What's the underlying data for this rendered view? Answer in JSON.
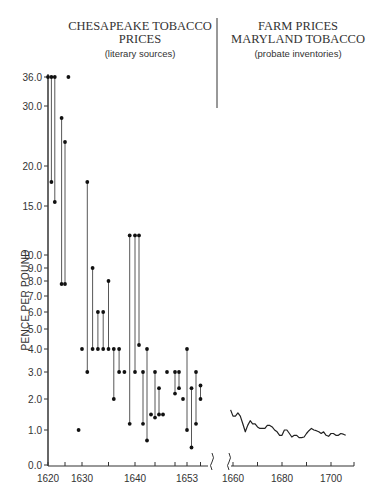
{
  "header": {
    "left_title_line1": "CHESAPEAKE TOBACCO",
    "left_title_line2": "PRICES",
    "left_subtitle": "(literary sources)",
    "right_title_line1": "FARM PRICES",
    "right_title_line2": "MARYLAND TOBACCO",
    "right_subtitle": "(probate inventories)"
  },
  "axis": {
    "ylabel": "PENCE PER POUND",
    "y_ticks": [
      "36.0",
      "30.0",
      "20.0",
      "15.0",
      "10.0",
      "9.0",
      "8.0",
      "7.0",
      "6.0",
      "5.0",
      "4.0",
      "3.0",
      "2.0",
      "1.0",
      "0.0"
    ],
    "x_ticks": [
      "1620",
      "1630",
      "1640",
      "1653",
      "1660",
      "1680",
      "1700"
    ]
  },
  "chart_data": {
    "type": "scatter",
    "xlabel": "",
    "ylabel": "PENCE PER POUND",
    "y_scale": "log-like (non-linear)",
    "ylim": [
      0,
      36
    ],
    "grid": false,
    "legend": null,
    "panels": [
      {
        "name": "Chesapeake Tobacco Prices (literary sources)",
        "type": "range-scatter",
        "note": "Points joined by vertical lines indicate high/low ranges within a year",
        "ranges": [
          {
            "year": 1620,
            "high": 36.0,
            "low": 0.0
          },
          {
            "year": 1621,
            "high": 36.0,
            "low": 18.0
          },
          {
            "year": 1622,
            "high": 36.0,
            "low": 15.5
          },
          {
            "year": 1624,
            "high": 28.0,
            "low": 7.8
          },
          {
            "year": 1625,
            "high": 24.0,
            "low": 7.8
          },
          {
            "year": 1626,
            "high": 36.0,
            "low": 36.0
          },
          {
            "year": 1629,
            "high": 1.0,
            "low": 1.0
          },
          {
            "year": 1630,
            "high": 4.0,
            "low": 4.0
          },
          {
            "year": 1631,
            "high": 18.0,
            "low": 3.0
          },
          {
            "year": 1632,
            "high": 9.0,
            "low": 4.0
          },
          {
            "year": 1633,
            "high": 6.0,
            "low": 4.0
          },
          {
            "year": 1634,
            "high": 6.0,
            "low": 4.0
          },
          {
            "year": 1635,
            "high": 8.0,
            "low": 4.0
          },
          {
            "year": 1636,
            "high": 4.0,
            "low": 2.0
          },
          {
            "year": 1637,
            "high": 4.0,
            "low": 3.0
          },
          {
            "year": 1638,
            "high": 3.0,
            "low": 3.0
          },
          {
            "year": 1639,
            "high": 12.0,
            "low": 1.2
          },
          {
            "year": 1640,
            "high": 12.0,
            "low": 3.0
          },
          {
            "year": 1641,
            "high": 12.0,
            "low": 4.2
          },
          {
            "year": 1642,
            "high": 3.0,
            "low": 1.2
          },
          {
            "year": 1643,
            "high": 4.0,
            "low": 0.7
          },
          {
            "year": 1644,
            "high": 1.5,
            "low": 1.5
          },
          {
            "year": 1645,
            "high": 3.0,
            "low": 1.4
          },
          {
            "year": 1646,
            "high": 2.4,
            "low": 1.5
          },
          {
            "year": 1647,
            "high": 1.5,
            "low": 1.5
          },
          {
            "year": 1648,
            "high": 3.0,
            "low": 3.0
          },
          {
            "year": 1650,
            "high": 3.0,
            "low": 2.2
          },
          {
            "year": 1651,
            "high": 3.0,
            "low": 2.4
          },
          {
            "year": 1652,
            "high": 2.0,
            "low": 2.0
          },
          {
            "year": 1653,
            "high": 4.0,
            "low": 1.0
          },
          {
            "year": 1654,
            "high": 2.4,
            "low": 0.5
          },
          {
            "year": 1655,
            "high": 3.0,
            "low": 1.2
          },
          {
            "year": 1656,
            "high": 2.5,
            "low": 2.0
          }
        ]
      },
      {
        "name": "Farm Prices Maryland Tobacco (probate inventories)",
        "type": "line",
        "x": [
          1659,
          1660,
          1661,
          1662,
          1663,
          1664,
          1665,
          1666,
          1667,
          1668,
          1669,
          1670,
          1671,
          1672,
          1673,
          1674,
          1675,
          1676,
          1677,
          1678,
          1679,
          1680,
          1681,
          1682,
          1683,
          1684,
          1685,
          1686,
          1687,
          1688,
          1689,
          1690,
          1691,
          1692,
          1693,
          1694,
          1695,
          1696,
          1697,
          1698,
          1699,
          1700,
          1701,
          1702,
          1703,
          1704,
          1705,
          1706
        ],
        "values": [
          1.65,
          1.45,
          1.45,
          1.55,
          1.45,
          1.2,
          0.95,
          1.15,
          1.3,
          1.2,
          1.2,
          1.1,
          1.05,
          1.05,
          1.05,
          1.15,
          1.15,
          1.1,
          1.0,
          0.95,
          0.85,
          0.85,
          1.0,
          1.0,
          0.9,
          0.8,
          0.85,
          0.85,
          0.78,
          0.78,
          0.8,
          0.9,
          0.98,
          1.05,
          1.0,
          0.98,
          0.95,
          0.9,
          0.95,
          0.85,
          0.82,
          0.9,
          0.9,
          0.85,
          0.85,
          0.9,
          0.88,
          0.85
        ]
      }
    ]
  }
}
